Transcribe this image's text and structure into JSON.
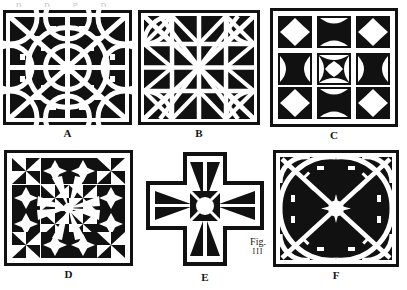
{
  "plate": {
    "caption_line1": "Fig.",
    "caption_line2": "III",
    "top_sliver_text": "p p g p",
    "ink": "#111111",
    "paper": "#ffffff"
  },
  "panels": [
    {
      "id": "A",
      "label": "A",
      "motif": "circular-interlace-lattice",
      "shape": "square",
      "x": 3,
      "y": 10,
      "w": 129,
      "h": 115
    },
    {
      "id": "B",
      "label": "B",
      "motif": "star-and-triangle-lattice",
      "shape": "square",
      "x": 138,
      "y": 10,
      "w": 122,
      "h": 115
    },
    {
      "id": "C",
      "label": "C",
      "motif": "nine-cell-curved-triangle-grid",
      "shape": "square",
      "x": 270,
      "y": 8,
      "w": 128,
      "h": 119
    },
    {
      "id": "D",
      "label": "D",
      "motif": "radiating-pinwheel-star-grid",
      "shape": "square",
      "x": 4,
      "y": 150,
      "w": 129,
      "h": 116
    },
    {
      "id": "E",
      "label": "E",
      "motif": "greek-cross-with-central-rosette",
      "shape": "cross",
      "x": 146,
      "y": 152,
      "w": 118,
      "h": 118
    },
    {
      "id": "F",
      "label": "F",
      "motif": "quarter-arc-spoke-lattice",
      "shape": "square",
      "x": 273,
      "y": 150,
      "w": 126,
      "h": 117
    }
  ]
}
